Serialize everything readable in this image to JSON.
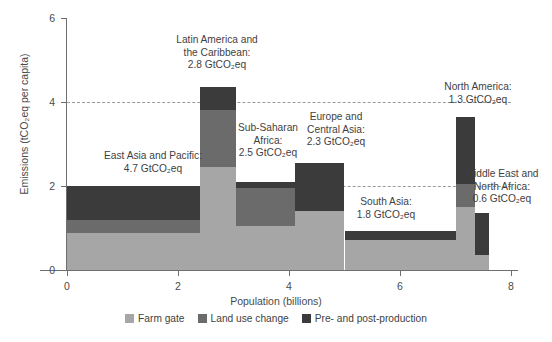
{
  "chart_data": {
    "type": "bar",
    "xlabel": "Population (billions)",
    "ylabel": "Emissions (tCO2eq per capita)",
    "ylabel_display": "Emissions (tCO₂eq per capita)",
    "xlim": [
      0,
      8
    ],
    "ylim": [
      0,
      6
    ],
    "xticks": [
      0,
      2,
      4,
      6,
      8
    ],
    "yticks": [
      0,
      2,
      4,
      6
    ],
    "grid": "dashed horizontal gridlines at y=2 and y=4",
    "legend_position": "bottom-center",
    "variable_width_bars": true,
    "series": [
      {
        "name": "Farm gate",
        "color": "#a6a6a6"
      },
      {
        "name": "Land use change",
        "color": "#6b6b6b"
      },
      {
        "name": "Pre- and post-production",
        "color": "#3b3b3b"
      }
    ],
    "categories": [
      "East Asia and Pacific",
      "Latin America and the Caribbean",
      "Sub-Saharan Africa",
      "Europe and Central Asia",
      "South Asia",
      "North America",
      "Middle East and North Africa"
    ],
    "bars": [
      {
        "region": "East Asia and Pacific",
        "total_emissions_gtco2eq": 4.7,
        "x_start": 0.0,
        "x_end": 2.4,
        "population_billions": 2.4,
        "per_capita_total": 2.0,
        "farm_gate": 0.87,
        "land_use_change": 0.31,
        "pre_and_post_production": 0.82
      },
      {
        "region": "Latin America and the Caribbean",
        "total_emissions_gtco2eq": 2.8,
        "x_start": 2.4,
        "x_end": 3.05,
        "population_billions": 0.65,
        "per_capita_total": 4.35,
        "farm_gate": 2.45,
        "land_use_change": 1.35,
        "pre_and_post_production": 0.55
      },
      {
        "region": "Sub-Saharan Africa",
        "total_emissions_gtco2eq": 2.5,
        "x_start": 3.05,
        "x_end": 4.1,
        "population_billions": 1.05,
        "per_capita_total": 2.1,
        "farm_gate": 1.05,
        "land_use_change": 0.9,
        "pre_and_post_production": 0.15
      },
      {
        "region": "Europe and Central Asia",
        "total_emissions_gtco2eq": 2.3,
        "x_start": 4.1,
        "x_end": 5.0,
        "population_billions": 0.9,
        "per_capita_total": 2.55,
        "farm_gate": 1.4,
        "land_use_change": 0.0,
        "pre_and_post_production": 1.15
      },
      {
        "region": "South Asia",
        "total_emissions_gtco2eq": 1.8,
        "x_start": 5.0,
        "x_end": 7.0,
        "population_billions": 2.0,
        "per_capita_total": 0.92,
        "farm_gate": 0.72,
        "land_use_change": 0.0,
        "pre_and_post_production": 0.2
      },
      {
        "region": "North America",
        "total_emissions_gtco2eq": 1.3,
        "x_start": 7.0,
        "x_end": 7.35,
        "population_billions": 0.35,
        "per_capita_total": 3.65,
        "farm_gate": 1.5,
        "land_use_change": 0.55,
        "pre_and_post_production": 1.6
      },
      {
        "region": "Middle East and North Africa",
        "total_emissions_gtco2eq": 0.6,
        "x_start": 7.35,
        "x_end": 7.6,
        "population_billions": 0.25,
        "per_capita_total": 1.35,
        "farm_gate": 0.35,
        "land_use_change": 0.0,
        "pre_and_post_production": 1.0
      }
    ],
    "annotations": [
      {
        "id": "east-asia",
        "text": "East Asia and Pacific:\n4.7 GtCO₂eq"
      },
      {
        "id": "latin-america",
        "text": "Latin America and\nthe Caribbean:\n2.8 GtCO₂eq"
      },
      {
        "id": "sub-saharan",
        "text": "Sub-Saharan\nAfrica:\n2.5 GtCO₂eq"
      },
      {
        "id": "europe",
        "text": "Europe and\nCentral Asia:\n2.3 GtCO₂eq"
      },
      {
        "id": "south-asia",
        "text": "South Asia:\n1.8 GtCO₂eq"
      },
      {
        "id": "north-america",
        "text": "North America:\n1.3 GtCO₂eq"
      },
      {
        "id": "middle-east",
        "text": "Middle East and\nNorth Africa:\n0.6 GtCO₂eq"
      }
    ]
  },
  "axes": {
    "y_ticks": [
      "0",
      "2",
      "4",
      "6"
    ],
    "x_ticks": [
      "0",
      "2",
      "4",
      "6",
      "8"
    ],
    "y_title": "Emissions (tCO₂eq per capita)",
    "x_title": "Population (billions)"
  },
  "legend": {
    "items": [
      {
        "label": "Farm gate",
        "color": "#a6a6a6"
      },
      {
        "label": "Land use change",
        "color": "#6b6b6b"
      },
      {
        "label": "Pre- and post-production",
        "color": "#3b3b3b"
      }
    ]
  },
  "annotations_text": {
    "east_asia": "East Asia and Pacific:\n4.7 GtCO₂eq",
    "latin_america": "Latin America and\nthe Caribbean:\n2.8 GtCO₂eq",
    "sub_saharan": "Sub-Saharan\nAfrica:\n2.5 GtCO₂eq",
    "europe": "Europe and\nCentral Asia:\n2.3 GtCO₂eq",
    "south_asia": "South Asia:\n1.8 GtCO₂eq",
    "north_america": "North America:\n1.3 GtCO₂eq",
    "middle_east": "Middle East and\nNorth Africa:\n0.6 GtCO₂eq"
  }
}
